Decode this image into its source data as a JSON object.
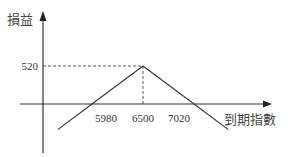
{
  "chart_data": {
    "type": "line",
    "title": "",
    "ylabel": "損益",
    "xlabel": "到期指數",
    "x_ticks": [
      5980,
      6500,
      7020
    ],
    "y_ticks": [
      520
    ],
    "series": [
      {
        "name": "payoff",
        "points": [
          {
            "x": 5630,
            "y": -350
          },
          {
            "x": 5980,
            "y": 0
          },
          {
            "x": 6500,
            "y": 520
          },
          {
            "x": 7020,
            "y": 0
          },
          {
            "x": 7370,
            "y": -350
          }
        ]
      }
    ],
    "reference_lines": [
      {
        "type": "horizontal-dashed",
        "y": 520,
        "from_x": "y-axis",
        "to_x": 6500
      },
      {
        "type": "vertical-dashed",
        "x": 6500,
        "from_y": 0,
        "to_y": 520
      }
    ],
    "grid": false,
    "legend": "none",
    "colors": {
      "line": "#333333",
      "axis": "#333333"
    }
  }
}
